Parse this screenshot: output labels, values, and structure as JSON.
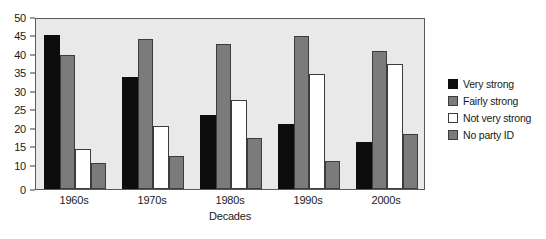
{
  "chart_data": {
    "type": "bar",
    "title": "",
    "xlabel": "Decades",
    "ylabel": "",
    "categories": [
      "1960s",
      "1970s",
      "1980s",
      "1990s",
      "2000s"
    ],
    "series": [
      {
        "name": "Very strong",
        "color": "#0d0d0d",
        "values": [
          45.2,
          33.8,
          23.6,
          21.0,
          16.2
        ]
      },
      {
        "name": "Fairly strong",
        "color": "#7b7b7b",
        "values": [
          39.8,
          44.1,
          42.6,
          44.9,
          40.9
        ]
      },
      {
        "name": "Not very strong",
        "color": "#ffffff",
        "values": [
          14.4,
          20.5,
          27.6,
          34.5,
          37.4
        ]
      },
      {
        "name": "No party ID",
        "color": "#7b7b7b",
        "values": [
          10.6,
          12.3,
          17.3,
          11.1,
          18.5
        ]
      }
    ],
    "ylim": [
      0,
      50
    ],
    "yticks": [
      0,
      10,
      15,
      20,
      25,
      30,
      35,
      40,
      45,
      50
    ],
    "ytick_labels": [
      "0",
      "10",
      "15",
      "20",
      "25",
      "30",
      "35",
      "40",
      "45",
      "50"
    ],
    "grid": false,
    "legend_position": "right",
    "plot_background": "#e9e9e9",
    "frame_color": "#5a5a5a"
  },
  "legend": {
    "items": [
      {
        "label": "Very strong"
      },
      {
        "label": "Fairly strong"
      },
      {
        "label": "Not very strong"
      },
      {
        "label": "No party ID"
      }
    ]
  },
  "axes": {
    "x_title": "Decades"
  }
}
